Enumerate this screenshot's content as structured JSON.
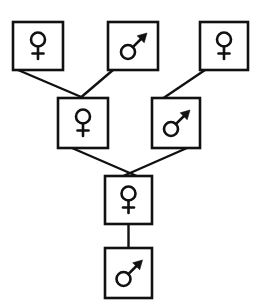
{
  "diagram": {
    "type": "pedigree-tree",
    "background_color": "#ffffff",
    "line_color": "#111111",
    "box_fill_color": "#ffffff",
    "symbols": {
      "female": "venus-symbol",
      "male": "mars-symbol"
    },
    "nodes": [
      {
        "id": "n1",
        "row": 1,
        "sex": "female",
        "symbol": "venus-symbol",
        "x": 13,
        "y": 22,
        "w": 50,
        "h": 48
      },
      {
        "id": "n2",
        "row": 1,
        "sex": "male",
        "symbol": "mars-symbol",
        "x": 108,
        "y": 22,
        "w": 50,
        "h": 48
      },
      {
        "id": "n3",
        "row": 1,
        "sex": "female",
        "symbol": "venus-symbol",
        "x": 200,
        "y": 22,
        "w": 48,
        "h": 48
      },
      {
        "id": "n4",
        "row": 2,
        "sex": "female",
        "symbol": "venus-symbol",
        "x": 58,
        "y": 98,
        "w": 50,
        "h": 50
      },
      {
        "id": "n5",
        "row": 2,
        "sex": "male",
        "symbol": "mars-symbol",
        "x": 152,
        "y": 98,
        "w": 48,
        "h": 50
      },
      {
        "id": "n6",
        "row": 3,
        "sex": "female",
        "symbol": "venus-symbol",
        "x": 105,
        "y": 176,
        "w": 47,
        "h": 48
      },
      {
        "id": "n7",
        "row": 4,
        "sex": "male",
        "symbol": "mars-symbol",
        "x": 105,
        "y": 248,
        "w": 47,
        "h": 50
      }
    ],
    "edges": [
      {
        "id": "e1",
        "from": "n1",
        "to": "n4",
        "x1": 18,
        "y1": 70,
        "x2": 86,
        "y2": 98
      },
      {
        "id": "e2",
        "from": "n2",
        "to": "n4",
        "x1": 113,
        "y1": 70,
        "x2": 80,
        "y2": 98
      },
      {
        "id": "e3",
        "from": "n3",
        "to": "n5",
        "x1": 205,
        "y1": 70,
        "x2": 163,
        "y2": 98
      },
      {
        "id": "e4",
        "from": "n4",
        "to": "n6",
        "x1": 72,
        "y1": 148,
        "x2": 138,
        "y2": 176
      },
      {
        "id": "e5",
        "from": "n5",
        "to": "n6",
        "x1": 186,
        "y1": 148,
        "x2": 122,
        "y2": 176
      },
      {
        "id": "e6",
        "from": "n6",
        "to": "n7",
        "x1": 128,
        "y1": 224,
        "x2": 128,
        "y2": 248
      }
    ]
  }
}
